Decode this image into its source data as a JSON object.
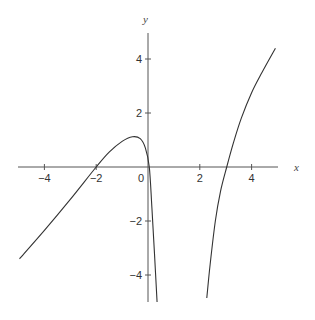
{
  "chart_data": {
    "type": "line",
    "title": "",
    "xlabel": "x",
    "ylabel": "y",
    "xlim": [
      -5,
      5
    ],
    "ylim": [
      -5,
      5
    ],
    "grid": false,
    "x_ticks": [
      -4,
      -2,
      0,
      2,
      4
    ],
    "y_ticks": [
      -4,
      -2,
      2,
      4
    ],
    "x_tick_labels": [
      "−4",
      "−2",
      "0",
      "2",
      "4"
    ],
    "y_tick_labels": [
      "−4",
      "−2",
      "2",
      "4"
    ],
    "series": [
      {
        "name": "left-branch",
        "color": "#333333",
        "points": [
          [
            -4.96,
            -3.4
          ],
          [
            -4.0,
            -2.35
          ],
          [
            -3.0,
            -1.2
          ],
          [
            -2.0,
            0.0
          ],
          [
            -1.5,
            0.55
          ],
          [
            -1.0,
            0.95
          ],
          [
            -0.6,
            1.12
          ],
          [
            -0.3,
            1.05
          ],
          [
            -0.1,
            0.7
          ],
          [
            0.05,
            0.0
          ],
          [
            0.15,
            -1.5
          ],
          [
            0.25,
            -3.2
          ],
          [
            0.35,
            -5.0
          ]
        ]
      },
      {
        "name": "right-branch",
        "color": "#333333",
        "points": [
          [
            2.27,
            -4.85
          ],
          [
            2.4,
            -3.6
          ],
          [
            2.6,
            -2.0
          ],
          [
            2.8,
            -0.9
          ],
          [
            3.04,
            0.0
          ],
          [
            3.3,
            0.9
          ],
          [
            3.6,
            1.8
          ],
          [
            4.0,
            2.75
          ],
          [
            4.4,
            3.5
          ],
          [
            4.92,
            4.4
          ]
        ]
      }
    ]
  },
  "labels": {
    "x_axis": "x",
    "y_axis": "y"
  }
}
